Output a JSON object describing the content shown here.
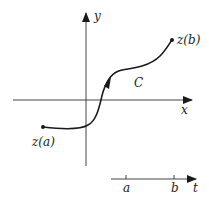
{
  "diagram": {
    "type": "parametric-curve",
    "colors": {
      "stroke": "#1a1a1a",
      "background": "#ffffff"
    },
    "axes": {
      "x_label": "x",
      "y_label": "y"
    },
    "curve": {
      "label": "C",
      "start_label": "z(a)",
      "end_label": "z(b)",
      "direction": "from z(a) to z(b)"
    },
    "parameter_axis": {
      "label": "t",
      "ticks": [
        "a",
        "b"
      ]
    }
  }
}
